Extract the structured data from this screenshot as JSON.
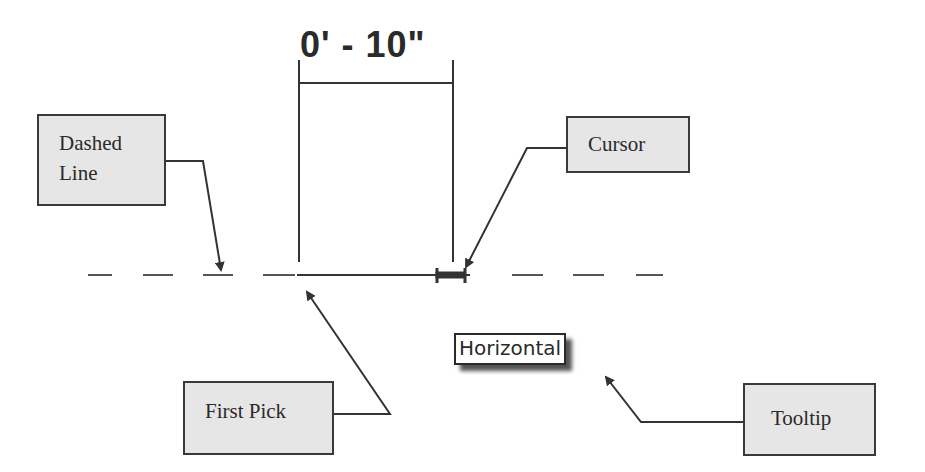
{
  "dimension": {
    "value": "0' - 10\""
  },
  "callouts": {
    "dashed_line": {
      "line1": "Dashed",
      "line2": "Line"
    },
    "cursor": {
      "label": "Cursor"
    },
    "first_pick": {
      "label": "First Pick"
    },
    "tooltip": {
      "label": "Tooltip"
    }
  },
  "tooltip_popup": {
    "text": "Horizontal"
  },
  "colors": {
    "stroke": "#333333",
    "callout_fill": "#e6e6e6",
    "background": "#ffffff"
  }
}
